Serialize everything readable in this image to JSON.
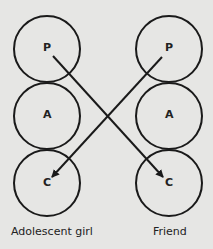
{
  "diagram": {
    "left_column": {
      "caption": "Adolescent girl",
      "circles": [
        {
          "label": "P"
        },
        {
          "label": "A"
        },
        {
          "label": "C"
        }
      ]
    },
    "right_column": {
      "caption": "Friend",
      "circles": [
        {
          "label": "P"
        },
        {
          "label": "A"
        },
        {
          "label": "C"
        }
      ]
    },
    "arrows": [
      {
        "from": "Adolescent girl P",
        "to": "Friend C"
      },
      {
        "from": "Friend P",
        "to": "Adolescent girl C"
      }
    ],
    "colors": {
      "stroke": "#1a1a1a",
      "background": "#e6e6e4"
    }
  }
}
